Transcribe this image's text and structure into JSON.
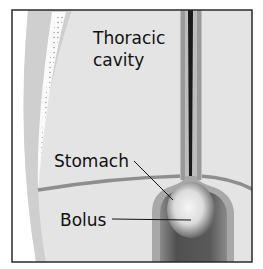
{
  "figure": {
    "type": "anatomical-illustration"
  },
  "labels": {
    "thoracic_line1": "Thoracic",
    "thoracic_line2": "cavity",
    "stomach": "Stomach",
    "bolus": "Bolus"
  },
  "colors": {
    "background": "#ffffff",
    "frame": "#2a2a2a",
    "tissue_fill": "#e4e4e4",
    "band_fill": "#cfcfcf",
    "rib_strip": "#fafafa",
    "esophagus_wall": "#9a9a9a",
    "esophagus_lumen": "#1a1a1a",
    "stomach_dark": "#5a5a5a",
    "bolus_light": "#f2f2f2",
    "leader_line": "#111111"
  }
}
